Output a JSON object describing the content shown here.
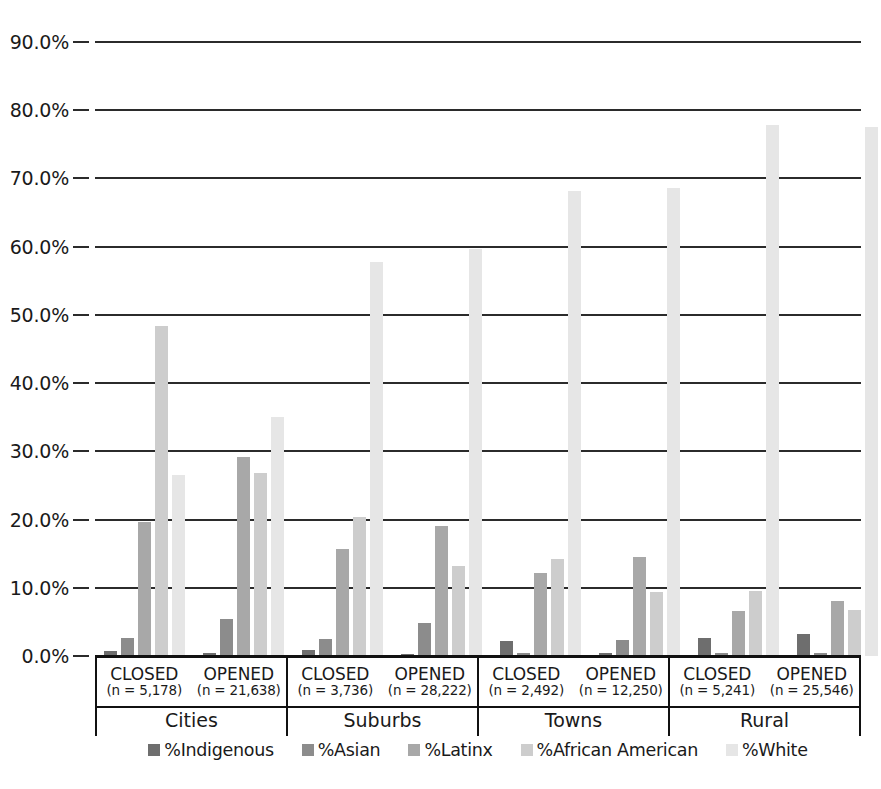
{
  "chart_data": {
    "type": "bar",
    "title": "",
    "subtitle": "",
    "xlabel": "",
    "ylabel": "",
    "ylim": [
      0,
      90
    ],
    "grid": true,
    "legend_position": "bottom",
    "y_ticks": [
      "0.0%",
      "10.0%",
      "20.0%",
      "30.0%",
      "40.0%",
      "50.0%",
      "60.0%",
      "70.0%",
      "80.0%",
      "90.0%"
    ],
    "y_tick_values": [
      0,
      10,
      20,
      30,
      40,
      50,
      60,
      70,
      80,
      90
    ],
    "series": [
      {
        "name": "%Indigenous",
        "color": "#6e6e6e",
        "values": [
          0.7,
          0.4,
          0.9,
          0.3,
          2.2,
          0.4,
          2.7,
          3.3
        ]
      },
      {
        "name": "%Asian",
        "color": "#8c8c8c",
        "values": [
          2.6,
          5.4,
          2.5,
          4.8,
          0.5,
          2.4,
          0.5,
          0.5
        ]
      },
      {
        "name": "%Latinx",
        "color": "#a8a8a8",
        "values": [
          19.6,
          29.2,
          15.7,
          19.0,
          12.2,
          14.5,
          6.6,
          8.1
        ]
      },
      {
        "name": "%African American",
        "color": "#cdcdcd",
        "values": [
          48.4,
          26.8,
          20.4,
          13.2,
          14.2,
          9.4,
          9.6,
          6.7
        ]
      },
      {
        "name": "%White",
        "color": "#e6e6e6",
        "values": [
          26.6,
          35.0,
          57.8,
          59.6,
          68.2,
          68.6,
          77.8,
          77.6
        ]
      }
    ],
    "categories": [
      "Cities CLOSED",
      "Cities OPENED",
      "Suburbs CLOSED",
      "Suburbs OPENED",
      "Towns CLOSED",
      "Towns OPENED",
      "Rural CLOSED",
      "Rural OPENED"
    ],
    "groups": [
      {
        "name": "Cities",
        "subgroups": [
          {
            "state": "CLOSED",
            "n": "(n = 5,178)",
            "values": [
              0.7,
              2.6,
              19.6,
              48.4,
              26.6
            ]
          },
          {
            "state": "OPENED",
            "n": "(n = 21,638)",
            "values": [
              0.4,
              5.4,
              29.2,
              26.8,
              35.0
            ]
          }
        ]
      },
      {
        "name": "Suburbs",
        "subgroups": [
          {
            "state": "CLOSED",
            "n": "(n = 3,736)",
            "values": [
              0.9,
              2.5,
              15.7,
              20.4,
              57.8
            ]
          },
          {
            "state": "OPENED",
            "n": "(n = 28,222)",
            "values": [
              0.3,
              4.8,
              19.0,
              13.2,
              59.6
            ]
          }
        ]
      },
      {
        "name": "Towns",
        "subgroups": [
          {
            "state": "CLOSED",
            "n": "(n = 2,492)",
            "values": [
              2.2,
              0.5,
              12.2,
              14.2,
              68.2
            ]
          },
          {
            "state": "OPENED",
            "n": "(n = 12,250)",
            "values": [
              0.4,
              2.4,
              14.5,
              9.4,
              68.6
            ]
          }
        ]
      },
      {
        "name": "Rural",
        "subgroups": [
          {
            "state": "CLOSED",
            "n": "(n = 5,241)",
            "values": [
              2.7,
              0.5,
              6.6,
              9.6,
              77.8
            ]
          },
          {
            "state": "OPENED",
            "n": "(n = 25,546)",
            "values": [
              3.3,
              0.5,
              8.1,
              6.7,
              77.6
            ]
          }
        ]
      }
    ]
  }
}
